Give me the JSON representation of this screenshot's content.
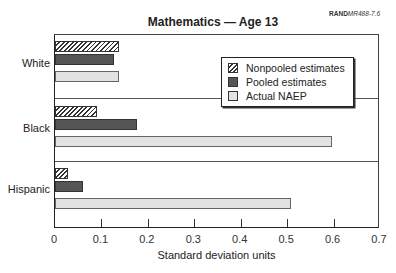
{
  "header": {
    "title": "Mathematics — Age 13",
    "ref_bold": "RAND",
    "ref_italic": "MR488-7.6"
  },
  "chart_data": {
    "type": "bar",
    "orientation": "horizontal",
    "title": "Mathematics — Age 13",
    "xlabel": "Standard deviation units",
    "ylabel": "",
    "xlim": [
      0,
      0.7
    ],
    "x_ticks": [
      "0",
      "0.1",
      "0.2",
      "0.3",
      "0.4",
      "0.5",
      "0.6",
      "0.7"
    ],
    "categories": [
      "White",
      "Black",
      "Hispanic"
    ],
    "series": [
      {
        "name": "Nonpooled estimates",
        "pattern": "hatched",
        "values": [
          0.137,
          0.09,
          0.028
        ]
      },
      {
        "name": "Pooled estimates",
        "color": "#555555",
        "values": [
          0.127,
          0.177,
          0.06
        ]
      },
      {
        "name": "Actual NAEP",
        "color": "#e2e2e2",
        "values": [
          0.137,
          0.597,
          0.508
        ]
      }
    ],
    "legend_position": "upper right",
    "grid": false
  },
  "legend": {
    "items": [
      "Nonpooled estimates",
      "Pooled estimates",
      "Actual NAEP"
    ]
  }
}
